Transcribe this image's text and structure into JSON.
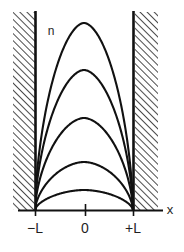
{
  "figure": {
    "title": "",
    "y_axis_label": "n",
    "x_axis_label": "x",
    "background_color": "#ffffff",
    "line_color": "#111111",
    "hatch_color": "#2b2b2b",
    "wall_color": "#111111"
  },
  "axes": {
    "x_axis_y_px": 210,
    "x_axis_start_px": 18,
    "x_axis_end_px": 163,
    "ticks": [
      {
        "label": "−L",
        "x_px": 35,
        "label_x_px": 35,
        "label_y_px": 233
      },
      {
        "label": "0",
        "x_px": 85,
        "label_x_px": 85,
        "label_y_px": 233
      },
      {
        "label": "+L",
        "x_px": 133,
        "label_x_px": 133,
        "label_y_px": 233
      }
    ],
    "x_axis_label_pos": {
      "x_px": 170,
      "y_px": 214
    },
    "y_axis_label_pos": {
      "x_px": 51,
      "y_px": 35
    }
  },
  "walls": {
    "left": {
      "name": "left-barrier",
      "hatch_x_px": 13,
      "hatch_width_px": 22,
      "top_px": 12,
      "bottom_px": 210,
      "edge_line_x_px": 36
    },
    "right": {
      "name": "right-barrier",
      "hatch_x_px": 135,
      "hatch_width_px": 23,
      "top_px": 12,
      "bottom_px": 210,
      "edge_line_x_px": 133
    }
  },
  "chart_data": {
    "type": "line",
    "title": "",
    "subtitle": "",
    "xlabel": "x",
    "ylabel": "n",
    "grid": false,
    "legend": "none",
    "xlim": [
      -1,
      1
    ],
    "ylim": [
      0,
      1
    ],
    "x_tick_labels": [
      "−L",
      "0",
      "+L"
    ],
    "x_tick_values": [
      -1,
      0,
      1
    ],
    "annotations": [
      {
        "text": "n",
        "x": -0.38,
        "y": 0.93
      },
      {
        "text": "x",
        "x": 1.45,
        "y": 0.02
      }
    ],
    "series": [
      {
        "name": "curve-1",
        "peak_amplitude": 1.0,
        "peak_y_px": 23,
        "exponent": 1.8,
        "points_x": [
          -1.0,
          -0.9,
          -0.8,
          -0.7,
          -0.6,
          -0.5,
          -0.4,
          -0.3,
          -0.2,
          -0.1,
          0.0,
          0.1,
          0.2,
          0.3,
          0.4,
          0.5,
          0.6,
          0.7,
          0.8,
          0.9,
          1.0
        ],
        "points_y": [
          0.0,
          0.287,
          0.479,
          0.634,
          0.758,
          0.854,
          0.924,
          0.969,
          0.992,
          1.0,
          1.0,
          1.0,
          0.992,
          0.969,
          0.924,
          0.854,
          0.758,
          0.634,
          0.479,
          0.287,
          0.0
        ]
      },
      {
        "name": "curve-2",
        "peak_amplitude": 0.74,
        "peak_y_px": 70,
        "exponent": 1.8,
        "points_x": [
          -1.0,
          -0.9,
          -0.8,
          -0.7,
          -0.6,
          -0.5,
          -0.4,
          -0.3,
          -0.2,
          -0.1,
          0.0,
          0.1,
          0.2,
          0.3,
          0.4,
          0.5,
          0.6,
          0.7,
          0.8,
          0.9,
          1.0
        ],
        "points_y": [
          0.0,
          0.212,
          0.355,
          0.469,
          0.561,
          0.632,
          0.684,
          0.717,
          0.734,
          0.74,
          0.74,
          0.74,
          0.734,
          0.717,
          0.684,
          0.632,
          0.561,
          0.469,
          0.355,
          0.212,
          0.0
        ]
      },
      {
        "name": "curve-3",
        "peak_amplitude": 0.49,
        "peak_y_px": 118,
        "exponent": 1.8,
        "points_x": [
          -1.0,
          -0.9,
          -0.8,
          -0.7,
          -0.6,
          -0.5,
          -0.4,
          -0.3,
          -0.2,
          -0.1,
          0.0,
          0.1,
          0.2,
          0.3,
          0.4,
          0.5,
          0.6,
          0.7,
          0.8,
          0.9,
          1.0
        ],
        "points_y": [
          0.0,
          0.141,
          0.235,
          0.311,
          0.372,
          0.419,
          0.453,
          0.475,
          0.486,
          0.49,
          0.49,
          0.49,
          0.486,
          0.475,
          0.453,
          0.419,
          0.372,
          0.311,
          0.235,
          0.141,
          0.0
        ]
      },
      {
        "name": "curve-4",
        "peak_amplitude": 0.265,
        "peak_y_px": 162,
        "exponent": 1.8,
        "points_x": [
          -1.0,
          -0.9,
          -0.8,
          -0.7,
          -0.6,
          -0.5,
          -0.4,
          -0.3,
          -0.2,
          -0.1,
          0.0,
          0.1,
          0.2,
          0.3,
          0.4,
          0.5,
          0.6,
          0.7,
          0.8,
          0.9,
          1.0
        ],
        "points_y": [
          0.0,
          0.076,
          0.127,
          0.168,
          0.201,
          0.226,
          0.245,
          0.257,
          0.263,
          0.265,
          0.265,
          0.265,
          0.263,
          0.257,
          0.245,
          0.226,
          0.201,
          0.168,
          0.127,
          0.076,
          0.0
        ]
      },
      {
        "name": "curve-5",
        "peak_amplitude": 0.105,
        "peak_y_px": 190,
        "exponent": 1.8,
        "points_x": [
          -1.0,
          -0.9,
          -0.8,
          -0.7,
          -0.6,
          -0.5,
          -0.4,
          -0.3,
          -0.2,
          -0.1,
          0.0,
          0.1,
          0.2,
          0.3,
          0.4,
          0.5,
          0.6,
          0.7,
          0.8,
          0.9,
          1.0
        ],
        "points_y": [
          0.0,
          0.03,
          0.05,
          0.067,
          0.08,
          0.09,
          0.097,
          0.102,
          0.104,
          0.105,
          0.105,
          0.105,
          0.104,
          0.102,
          0.097,
          0.09,
          0.08,
          0.067,
          0.05,
          0.03,
          0.0
        ]
      }
    ]
  }
}
